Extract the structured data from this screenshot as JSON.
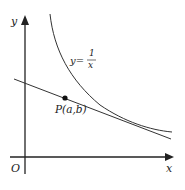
{
  "diagram": {
    "axes": {
      "x_label": "x",
      "y_label": "y",
      "origin_label": "O"
    },
    "curve": {
      "equation_lhs": "y=",
      "numerator": "1",
      "denominator": "x"
    },
    "point": {
      "label": "P(a,b)"
    },
    "colors": {
      "stroke": "#222222",
      "background": "#ffffff"
    }
  }
}
